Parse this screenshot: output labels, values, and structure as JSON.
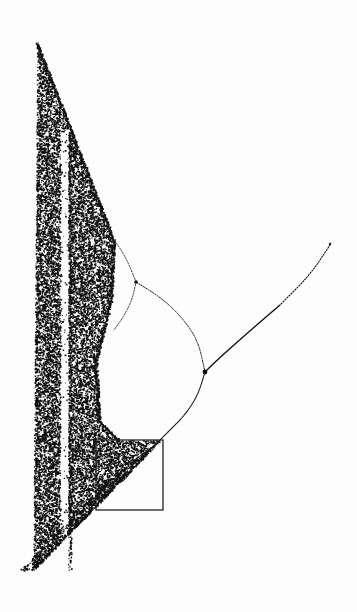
{
  "figure": {
    "ink_color": "#111111",
    "background_color": "#fdfdfd"
  },
  "chart_data": {
    "type": "scatter",
    "title": "",
    "xlabel": "",
    "ylabel": "",
    "grid": false,
    "legend": null,
    "annotations": [
      {
        "kind": "rectangle",
        "label": "zoom-region",
        "x0": 96,
        "y0": 440,
        "x1": 163,
        "y1": 510
      }
    ],
    "features": {
      "period1_branch": [
        [
          330,
          245
        ],
        [
          310,
          275
        ],
        [
          280,
          305
        ],
        [
          245,
          335
        ],
        [
          215,
          362
        ],
        [
          205,
          372
        ]
      ],
      "period2_fork": [
        205,
        372
      ],
      "period2_upper_arc": [
        [
          205,
          372
        ],
        [
          198,
          340
        ],
        [
          180,
          315
        ],
        [
          160,
          297
        ],
        [
          136,
          282
        ]
      ],
      "period2_lower_arc": [
        [
          205,
          372
        ],
        [
          198,
          395
        ],
        [
          185,
          415
        ],
        [
          170,
          430
        ],
        [
          160,
          440
        ],
        [
          150,
          450
        ],
        [
          132,
          465
        ]
      ],
      "period4_fork_upper": [
        136,
        282
      ],
      "period4_fork_lower": [
        132,
        465
      ],
      "chaos_tip": [
        37,
        40
      ],
      "chaos_bottom": [
        33,
        570
      ],
      "period3_window_x": [
        60,
        68
      ]
    }
  }
}
